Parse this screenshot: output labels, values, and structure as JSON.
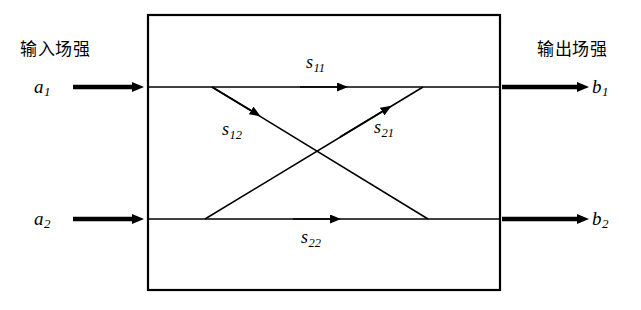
{
  "diagram": {
    "title_left": "输入场强",
    "title_right": "输出场强",
    "ports": {
      "in_top": {
        "base": "a",
        "sub": "1"
      },
      "in_bottom": {
        "base": "a",
        "sub": "2"
      },
      "out_top": {
        "base": "b",
        "sub": "1"
      },
      "out_bottom": {
        "base": "b",
        "sub": "2"
      }
    },
    "s_params": {
      "s11": {
        "base": "s",
        "sub": "11"
      },
      "s12": {
        "base": "s",
        "sub": "12"
      },
      "s21": {
        "base": "s",
        "sub": "21"
      },
      "s22": {
        "base": "s",
        "sub": "22"
      }
    },
    "colors": {
      "stroke": "#000000",
      "background": "#ffffff"
    }
  }
}
